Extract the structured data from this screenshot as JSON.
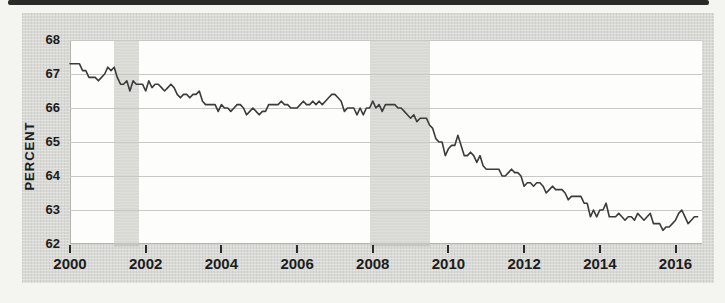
{
  "chart_data": {
    "type": "line",
    "title": "",
    "xlabel": "",
    "ylabel": "PERCENT",
    "x_tick_labels": [
      "2000",
      "2002",
      "2004",
      "2006",
      "2008",
      "2010",
      "2012",
      "2014",
      "2016"
    ],
    "y_tick_labels": [
      "68",
      "67",
      "66",
      "65",
      "64",
      "63",
      "62"
    ],
    "xlim": [
      2000,
      2016.7
    ],
    "ylim": [
      62,
      68
    ],
    "grid": "horizontal",
    "frequency": "monthly",
    "x_start_year": 2000,
    "series": [
      {
        "name": "percent",
        "values": [
          67.3,
          67.3,
          67.3,
          67.3,
          67.1,
          67.1,
          66.9,
          66.9,
          66.9,
          66.8,
          66.9,
          67.0,
          67.2,
          67.1,
          67.2,
          66.9,
          66.7,
          66.7,
          66.8,
          66.5,
          66.8,
          66.7,
          66.7,
          66.7,
          66.5,
          66.8,
          66.6,
          66.7,
          66.7,
          66.6,
          66.5,
          66.6,
          66.7,
          66.6,
          66.4,
          66.3,
          66.4,
          66.4,
          66.3,
          66.4,
          66.4,
          66.5,
          66.2,
          66.1,
          66.1,
          66.1,
          66.1,
          65.9,
          66.1,
          66.0,
          66.0,
          65.9,
          66.0,
          66.1,
          66.1,
          66.0,
          65.8,
          65.9,
          66.0,
          65.9,
          65.8,
          65.9,
          65.9,
          66.1,
          66.1,
          66.1,
          66.1,
          66.2,
          66.1,
          66.1,
          66.0,
          66.0,
          66.0,
          66.1,
          66.2,
          66.1,
          66.1,
          66.2,
          66.1,
          66.2,
          66.1,
          66.2,
          66.3,
          66.4,
          66.4,
          66.3,
          66.2,
          65.9,
          66.0,
          66.0,
          66.0,
          65.8,
          66.0,
          65.8,
          66.0,
          66.0,
          66.2,
          66.0,
          66.1,
          65.9,
          66.1,
          66.1,
          66.1,
          66.1,
          66.0,
          66.0,
          65.9,
          65.8,
          65.7,
          65.8,
          65.6,
          65.7,
          65.7,
          65.7,
          65.5,
          65.4,
          65.1,
          65.0,
          65.0,
          64.6,
          64.8,
          64.9,
          64.9,
          65.2,
          64.9,
          64.6,
          64.6,
          64.7,
          64.6,
          64.4,
          64.6,
          64.3,
          64.2,
          64.2,
          64.2,
          64.2,
          64.2,
          64.0,
          64.0,
          64.1,
          64.2,
          64.1,
          64.1,
          64.0,
          63.7,
          63.8,
          63.8,
          63.7,
          63.8,
          63.8,
          63.7,
          63.5,
          63.6,
          63.7,
          63.6,
          63.6,
          63.6,
          63.5,
          63.3,
          63.4,
          63.4,
          63.4,
          63.4,
          63.2,
          63.2,
          62.8,
          63.0,
          62.8,
          63.0,
          63.0,
          63.2,
          62.8,
          62.8,
          62.8,
          62.9,
          62.8,
          62.7,
          62.8,
          62.8,
          62.7,
          62.9,
          62.8,
          62.7,
          62.8,
          62.9,
          62.6,
          62.6,
          62.6,
          62.4,
          62.5,
          62.5,
          62.6,
          62.7,
          62.9,
          63.0,
          62.8,
          62.6,
          62.7,
          62.8,
          62.8
        ]
      }
    ],
    "recession_shading": [
      {
        "start_year": 2001.17,
        "end_year": 2001.83
      },
      {
        "start_year": 2007.92,
        "end_year": 2009.5
      }
    ],
    "colors": {
      "line": "#3b3b3b",
      "band": "#c9c9c4",
      "grid": "#c8c8c4",
      "plot_bg": "#fdfdfc",
      "panel_bg": "#d9d9d6",
      "text": "#1c1c1c"
    }
  }
}
